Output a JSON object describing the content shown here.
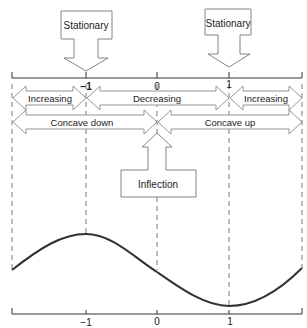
{
  "labels": {
    "stationary_left": "Stationary",
    "stationary_right": "Stationary",
    "inflection": "Inflection",
    "increasing_left": "Increasing",
    "decreasing": "Decreasing",
    "increasing_right": "Increasing",
    "concave_down": "Concave down",
    "concave_up": "Concave up"
  },
  "top_axis": {
    "ticks": [
      "−1",
      "0",
      "1"
    ]
  },
  "bottom_axis": {
    "ticks": [
      "−1",
      "0",
      "1"
    ]
  },
  "colors": {
    "curve": "#333333",
    "lines": "#444444",
    "box_stroke": "#777777"
  }
}
